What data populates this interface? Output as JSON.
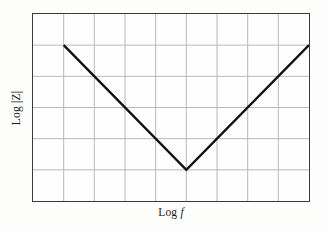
{
  "chart_data": {
    "type": "line",
    "title": "",
    "subtitle": "",
    "xlabel_prefix": "Log",
    "xlabel_variable": "f",
    "xlabel": "Log f",
    "ylabel": "Log |Z|",
    "legend": [],
    "annotations": [],
    "grid": true,
    "grid_columns": 9,
    "grid_rows": 6,
    "xlim": [
      0,
      9
    ],
    "ylim": [
      0,
      6
    ],
    "xticklabels": [],
    "yticklabels": [],
    "series": [
      {
        "name": "Log |Z|",
        "color": "#111111",
        "linewidth": 2.4,
        "x": [
          1,
          5,
          9
        ],
        "y": [
          5,
          1,
          5
        ],
        "description": "V-shaped impedance magnitude: descending slope -1 from (1,5) to minimum (5,1), then ascending slope +1 to (9,5)"
      }
    ],
    "colors": {
      "line": "#111111",
      "frame": "#3a3a3a",
      "grid": "#b8b8b8",
      "background": "#fefefe",
      "page_background": "#fdfdfc",
      "text": "#1a1a1a"
    }
  },
  "axes": {
    "y_axis_label": "Log |Z|",
    "x_axis_label": "Log f"
  }
}
